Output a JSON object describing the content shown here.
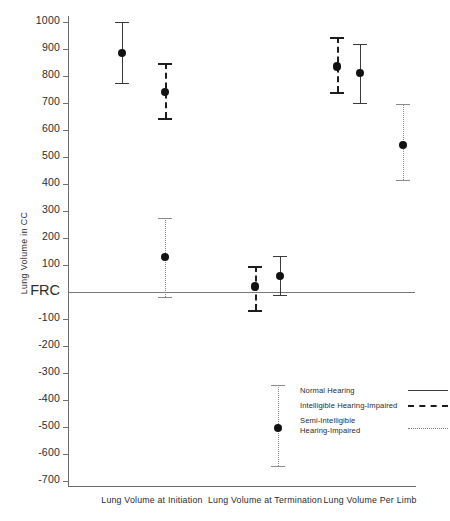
{
  "chart_data": {
    "type": "scatter",
    "title": "",
    "xlabel": "",
    "ylabel": "Lung Volume in CC",
    "ylim": [
      -700,
      1000
    ],
    "ytick_values": [
      1000,
      900,
      800,
      700,
      600,
      500,
      400,
      300,
      200,
      100,
      0,
      -100,
      -200,
      -300,
      -400,
      -500,
      -600,
      -700
    ],
    "ytick_labels": [
      "1000",
      "900",
      "800",
      "700",
      "600",
      "500",
      "400",
      "300",
      "200",
      "100",
      "FRC",
      "-100",
      "-200",
      "-300",
      "-400",
      "-500",
      "-600",
      "-700"
    ],
    "grid": false,
    "legend_position": "bottom-right",
    "reference_line": {
      "label": "FRC",
      "value": 0
    },
    "categories": [
      "Lung Volume at Initiation",
      "Lung Volume at Termination",
      "Lung Volume Per Limb"
    ],
    "series": [
      {
        "name": "Normal Hearing",
        "style": "solid",
        "values": [
          885,
          60,
          810
        ],
        "err_low": [
          775,
          -10,
          700
        ],
        "err_high": [
          1000,
          135,
          920
        ]
      },
      {
        "name": "Intelligible Hearing-Impaired",
        "style": "dashed",
        "values": [
          740,
          20,
          835
        ],
        "err_low": [
          645,
          -65,
          740
        ],
        "err_high": [
          850,
          95,
          945
        ]
      },
      {
        "name": "Semi-Intelligible Hearing-Impaired",
        "style": "dotted",
        "values": [
          130,
          -505,
          545
        ],
        "err_low": [
          -20,
          -645,
          415
        ],
        "err_high": [
          275,
          -345,
          695
        ]
      }
    ]
  },
  "legend": {
    "entries": [
      {
        "label": "Normal Hearing",
        "label2": ""
      },
      {
        "label": "Intelligible Hearing-Impaired",
        "label2": ""
      },
      {
        "label": "Semi-Intelligible",
        "label2": "Hearing-Impaired"
      }
    ]
  },
  "axis": {
    "y_title": "Lung Volume in CC"
  }
}
